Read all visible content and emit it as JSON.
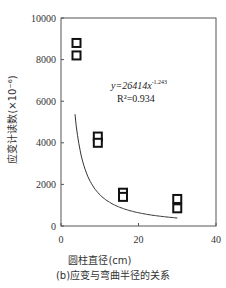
{
  "chart_data": {
    "type": "scatter",
    "title": "",
    "caption": "(b)应变与弯曲半径的关系",
    "xlabel": "圆柱直径(cm)",
    "ylabel": "应变计读数(×10⁻⁶)",
    "xlim": [
      0,
      40
    ],
    "ylim": [
      0,
      10000
    ],
    "x_ticks": [
      0,
      20,
      40
    ],
    "y_ticks": [
      0,
      2000,
      4000,
      6000,
      8000,
      10000
    ],
    "grid": false,
    "legend": null,
    "series": [
      {
        "name": "measured",
        "marker": "hollow-square",
        "points": [
          {
            "x": 4,
            "y": 8800
          },
          {
            "x": 4,
            "y": 8200
          },
          {
            "x": 9.5,
            "y": 4300
          },
          {
            "x": 9.5,
            "y": 4000
          },
          {
            "x": 16,
            "y": 1600
          },
          {
            "x": 16,
            "y": 1400
          },
          {
            "x": 30,
            "y": 1300
          },
          {
            "x": 30,
            "y": 850
          }
        ]
      },
      {
        "name": "power fit",
        "type": "line",
        "equation": "y=26414x^-1.243",
        "coefficient": 26414,
        "exponent": -1.243,
        "x_range": [
          3.6,
          30
        ]
      }
    ],
    "annotations": [
      {
        "text": "y=26414x",
        "superscript": "-1.243",
        "x_pos": 30,
        "y_pos": 6400
      },
      {
        "text": "R²=0.934",
        "x_pos": 30,
        "y_pos": 5800
      }
    ]
  },
  "labels": {
    "xlabel": "圆柱直径(cm)",
    "ylabel": "应变计读数(×10⁻⁶)",
    "caption": "(b)应变与弯曲半径的关系",
    "eq_main": "y=26414x",
    "eq_sup": "-1.243",
    "r2": "R²=0.934"
  }
}
